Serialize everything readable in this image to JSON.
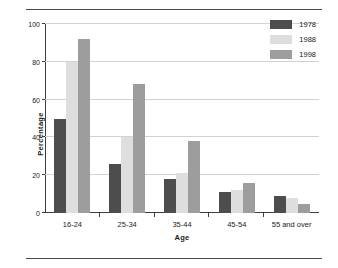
{
  "figure": {
    "rule_top": "horizontal-rule",
    "rule_bottom": "horizontal-rule"
  },
  "chart_data": {
    "type": "bar",
    "title": "",
    "xlabel": "Age",
    "ylabel": "Percentage",
    "categories": [
      "16-24",
      "25-34",
      "35-44",
      "45-54",
      "55 and over"
    ],
    "series": [
      {
        "name": "1978",
        "color": "#4d4d4d",
        "values": [
          50,
          26,
          18,
          11,
          9
        ]
      },
      {
        "name": "1988",
        "color": "#dedede",
        "values": [
          80,
          40,
          21,
          12,
          8
        ]
      },
      {
        "name": "1998",
        "color": "#9d9d9d",
        "values": [
          92,
          68,
          38,
          16,
          5
        ]
      }
    ],
    "ylim": [
      0,
      100
    ],
    "yticks": [
      0,
      20,
      40,
      60,
      80,
      100
    ],
    "ytick_labels": [
      "0",
      "20",
      "40",
      "60",
      "80",
      "100"
    ],
    "grid": true,
    "grid_color": "#d2d2d2",
    "legend_position": "top-right",
    "axis_color": "#3d3d3d",
    "background": "#ffffff"
  }
}
